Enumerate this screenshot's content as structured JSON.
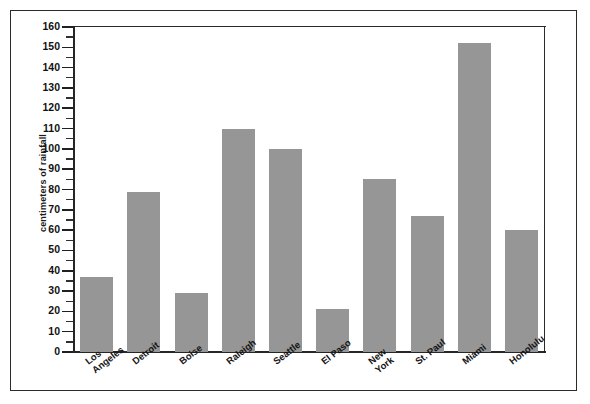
{
  "chart_data": {
    "type": "bar",
    "title": "",
    "subtitle": "",
    "xlabel": "",
    "ylabel": "centimeters of rainfall",
    "ylim": [
      0,
      160
    ],
    "ytick_step": 10,
    "yminor_step": 5,
    "grid": false,
    "legend": null,
    "bar_color": "#969696",
    "axis_color": "#262626",
    "categories": [
      "Los Angeles",
      "Detroit",
      "Boise",
      "Raleigh",
      "Seattle",
      "El Paso",
      "New York",
      "St. Paul",
      "Miami",
      "Honolulu"
    ],
    "category_lines": [
      [
        "Los",
        "Angeles"
      ],
      [
        "Detroit"
      ],
      [
        "Boise"
      ],
      [
        "Raleigh"
      ],
      [
        "Seattle"
      ],
      [
        "El Paso"
      ],
      [
        "New",
        "York"
      ],
      [
        "St. Paul"
      ],
      [
        "Miami"
      ],
      [
        "Honolulu"
      ]
    ],
    "values": [
      37,
      79,
      29,
      110,
      100,
      21,
      85,
      67,
      152,
      60
    ],
    "ytick_labels": [
      "0",
      "10",
      "20",
      "30",
      "40",
      "50",
      "60",
      "70",
      "80",
      "90",
      "100",
      "110",
      "120",
      "130",
      "140",
      "150",
      "160"
    ]
  }
}
